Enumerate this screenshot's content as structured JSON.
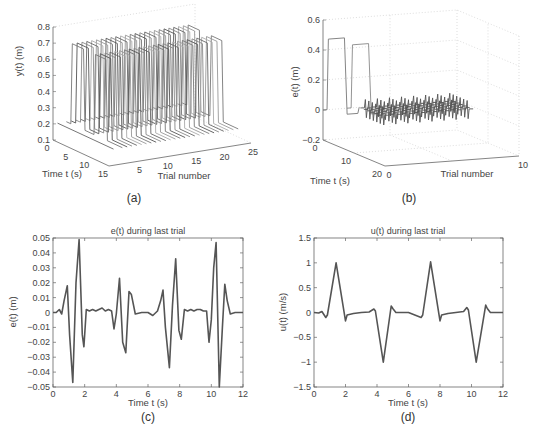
{
  "chart_data": [
    {
      "id": "a",
      "type": "line3d",
      "caption": "(a)",
      "title": "",
      "zlabel": "y(t) (m)",
      "xlabel": "Time t (s)",
      "ylabel": "Trial number",
      "zticks": [
        "0.1",
        "0.2",
        "0.3",
        "0.4",
        "0.5",
        "0.6",
        "0.7",
        "0.8"
      ],
      "zlim": [
        0.1,
        0.8
      ],
      "time_ticks": [
        "0",
        "5",
        "10",
        "15"
      ],
      "time_lim": [
        0,
        15
      ],
      "trial_ticks": [
        "5",
        "10",
        "15",
        "20",
        "25"
      ],
      "trial_lim": [
        0,
        25
      ],
      "series_description": "One output trajectory y(t) per trial (about 25 trials); each is a pair of pulses rising from ~0.2 m to ~0.7 m",
      "pulse_low": 0.2,
      "pulse_high": 0.7,
      "grid": true
    },
    {
      "id": "b",
      "type": "line3d",
      "caption": "(b)",
      "title": "",
      "zlabel": "e(t) (m)",
      "xlabel": "Time t (s)",
      "ylabel": "Trial number",
      "zticks": [
        "-0.2",
        "0",
        "0.2",
        "0.4",
        "0.6"
      ],
      "zlim": [
        -0.2,
        0.6
      ],
      "time_ticks": [
        "0",
        "10",
        "20"
      ],
      "time_lim": [
        0,
        20
      ],
      "trial_ticks": [
        "0",
        "10"
      ],
      "trial_lim": [
        0,
        10
      ],
      "series_description": "Tracking error per trial: first trial shows two pulses ~0.47 m, later trials converge to small oscillations around 0",
      "first_trial_peak": 0.47,
      "grid": true
    },
    {
      "id": "c",
      "type": "line",
      "caption": "(c)",
      "title": "e(t) during last trial",
      "xlabel": "Time t (s)",
      "ylabel": "e(t) (m)",
      "xlim": [
        0,
        12
      ],
      "ylim": [
        -0.05,
        0.05
      ],
      "xticks": [
        "0",
        "2",
        "4",
        "6",
        "8",
        "10",
        "12"
      ],
      "yticks": [
        "-0.05",
        "-0.04",
        "-0.03",
        "-0.02",
        "-0.01",
        "0",
        "0.01",
        "0.02",
        "0.03",
        "0.04",
        "0.05"
      ],
      "grid": false,
      "x": [
        0,
        0.2,
        0.4,
        0.55,
        0.7,
        0.9,
        1.05,
        1.25,
        1.45,
        1.65,
        1.85,
        1.95,
        2.1,
        2.3,
        2.5,
        2.7,
        2.9,
        3.1,
        3.3,
        3.5,
        3.7,
        3.85,
        4.0,
        4.2,
        4.4,
        4.6,
        4.8,
        4.95,
        5.2,
        5.6,
        6.0,
        6.3,
        6.6,
        6.8,
        6.95,
        7.1,
        7.35,
        7.55,
        7.75,
        7.95,
        8.1,
        8.3,
        8.5,
        8.7,
        8.9,
        9.1,
        9.3,
        9.5,
        9.7,
        9.85,
        10.0,
        10.15,
        10.3,
        10.5,
        10.7,
        10.85,
        11.0,
        11.2,
        11.5,
        12.0
      ],
      "y": [
        0,
        0,
        0.002,
        -0.001,
        0.008,
        0.018,
        -0.015,
        -0.047,
        0.02,
        0.049,
        -0.015,
        -0.023,
        0.002,
        0.001,
        0.002,
        0.001,
        0.002,
        0.003,
        0.001,
        0.002,
        0.001,
        -0.011,
        -0.001,
        0.023,
        -0.02,
        -0.027,
        0.014,
        0.012,
        -0.001,
        0,
        0,
        -0.002,
        0.001,
        0.008,
        0.015,
        -0.01,
        -0.037,
        0.005,
        0.036,
        -0.012,
        -0.018,
        0.002,
        0.001,
        0.002,
        0.001,
        0.002,
        0.002,
        0.001,
        0.001,
        -0.02,
        -0.005,
        0.03,
        0.047,
        -0.05,
        -0.01,
        0.019,
        0.008,
        -0.001,
        0,
        0
      ]
    },
    {
      "id": "d",
      "type": "line",
      "caption": "(d)",
      "title": "u(t) during last trial",
      "xlabel": "Time t (s)",
      "ylabel": "u(t) (m/s)",
      "xlim": [
        0,
        12
      ],
      "ylim": [
        -1.5,
        1.5
      ],
      "xticks": [
        "0",
        "2",
        "4",
        "6",
        "8",
        "10",
        "12"
      ],
      "yticks": [
        "-1.5",
        "-1",
        "-0.5",
        "0",
        "0.5",
        "1",
        "1.5"
      ],
      "grid": false,
      "x": [
        0,
        0.3,
        0.5,
        0.75,
        0.85,
        1.4,
        2.0,
        2.1,
        2.5,
        3.0,
        3.5,
        3.8,
        3.9,
        4.4,
        4.9,
        5.0,
        5.2,
        6.0,
        6.8,
        6.9,
        7.4,
        8.0,
        8.1,
        8.5,
        9.0,
        9.5,
        9.7,
        9.8,
        10.3,
        10.9,
        11.0,
        11.2,
        12.0
      ],
      "y": [
        0,
        -0.01,
        0.02,
        -0.1,
        -0.05,
        1.0,
        -0.17,
        -0.05,
        -0.02,
        0,
        0.01,
        0.07,
        0.03,
        -1.0,
        0.13,
        0.08,
        0,
        0,
        -0.1,
        -0.05,
        1.02,
        -0.17,
        -0.05,
        -0.02,
        0,
        0.02,
        0.1,
        0.05,
        -1.0,
        0.15,
        0.08,
        0,
        0
      ]
    }
  ],
  "figure": {
    "line_color": "#555555",
    "axis_color": "#666666",
    "grid_color": "#bbbbbb"
  }
}
